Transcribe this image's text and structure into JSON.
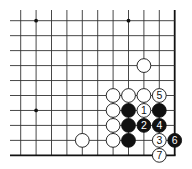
{
  "diagram": {
    "type": "go-board-fragment",
    "corner": "bottom-right",
    "grid": {
      "columns": 11,
      "rows": 10,
      "origin_x": 20.7,
      "origin_y": 20.7,
      "spacing_x": 15.4,
      "spacing_y": 14.96,
      "right_edge": true,
      "bottom_edge": true,
      "line_color": "#333333",
      "edge_color": "#111111"
    },
    "star_points": [
      {
        "col": 1,
        "row": 0
      },
      {
        "col": 7,
        "row": 0
      },
      {
        "col": 1,
        "row": 6
      }
    ],
    "stones": [
      {
        "col": 8,
        "row": 3,
        "color": "white",
        "label": ""
      },
      {
        "col": 6,
        "row": 5,
        "color": "white",
        "label": ""
      },
      {
        "col": 7,
        "row": 5,
        "color": "white",
        "label": ""
      },
      {
        "col": 8,
        "row": 5,
        "color": "white",
        "label": ""
      },
      {
        "col": 9,
        "row": 5,
        "color": "white",
        "label": "5"
      },
      {
        "col": 6,
        "row": 6,
        "color": "white",
        "label": ""
      },
      {
        "col": 7,
        "row": 6,
        "color": "black",
        "label": ""
      },
      {
        "col": 8,
        "row": 6,
        "color": "white",
        "label": "1"
      },
      {
        "col": 9,
        "row": 6,
        "color": "black",
        "label": ""
      },
      {
        "col": 6,
        "row": 7,
        "color": "white",
        "label": ""
      },
      {
        "col": 7,
        "row": 7,
        "color": "black",
        "label": ""
      },
      {
        "col": 8,
        "row": 7,
        "color": "black",
        "label": "2"
      },
      {
        "col": 9,
        "row": 7,
        "color": "black",
        "label": "4"
      },
      {
        "col": 4,
        "row": 8,
        "color": "white",
        "label": ""
      },
      {
        "col": 6,
        "row": 8,
        "color": "white",
        "label": ""
      },
      {
        "col": 7,
        "row": 8,
        "color": "black",
        "label": ""
      },
      {
        "col": 9,
        "row": 8,
        "color": "white",
        "label": "3"
      },
      {
        "col": 10,
        "row": 8,
        "color": "black",
        "label": "6"
      },
      {
        "col": 9,
        "row": 9,
        "color": "white",
        "label": "7"
      }
    ]
  }
}
